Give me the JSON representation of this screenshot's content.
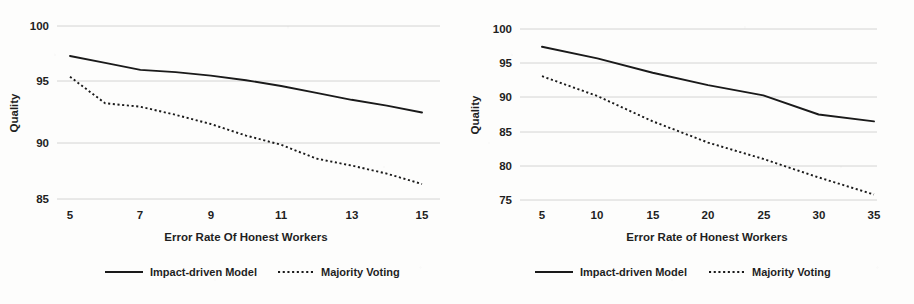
{
  "figure": {
    "panel_count": 2,
    "background_color": "#fdfdfc",
    "line_color": "#1a1a1a",
    "grid_color": "#c9c9c9"
  },
  "chart_data": [
    {
      "type": "line",
      "panel": "left",
      "title": "",
      "xlabel": "Error Rate Of Honest Workers",
      "ylabel": "Quality",
      "xlim": [
        5,
        15
      ],
      "ylim": [
        85,
        100
      ],
      "xticks": [
        5,
        7,
        9,
        11,
        13,
        15
      ],
      "yticks": [
        85,
        90,
        95,
        100
      ],
      "xtick_labels": [
        "5",
        "7",
        "9",
        "11",
        "13",
        "15"
      ],
      "ytick_labels": [
        "85",
        "90",
        "95",
        "100"
      ],
      "grid": "horizontal",
      "legend_position": "bottom",
      "x": [
        5,
        6,
        7,
        8,
        9,
        10,
        11,
        12,
        13,
        14,
        15
      ],
      "series": [
        {
          "name": "Impact-driven Model",
          "style": "solid",
          "values": [
            97.4,
            96.8,
            96.2,
            96.0,
            95.7,
            95.3,
            94.8,
            94.2,
            93.6,
            93.1,
            92.5
          ]
        },
        {
          "name": "Majority Voting",
          "style": "dotted",
          "values": [
            95.6,
            93.3,
            93.0,
            92.3,
            91.5,
            90.5,
            89.7,
            88.5,
            87.9,
            87.2,
            86.3
          ]
        }
      ]
    },
    {
      "type": "line",
      "panel": "right",
      "title": "",
      "xlabel": "Error Rate of Honest Workers",
      "ylabel": "Quality",
      "xlim": [
        5,
        35
      ],
      "ylim": [
        75,
        100
      ],
      "xticks": [
        5,
        10,
        15,
        20,
        25,
        30,
        35
      ],
      "yticks": [
        75,
        80,
        85,
        90,
        95,
        100
      ],
      "xtick_labels": [
        "5",
        "10",
        "15",
        "20",
        "25",
        "30",
        "35"
      ],
      "ytick_labels": [
        "75",
        "80",
        "85",
        "90",
        "95",
        "100"
      ],
      "grid": "horizontal",
      "legend_position": "bottom",
      "x": [
        5,
        10,
        15,
        20,
        25,
        30,
        35
      ],
      "series": [
        {
          "name": "Impact-driven Model",
          "style": "solid",
          "values": [
            97.4,
            95.7,
            93.6,
            91.8,
            90.3,
            87.5,
            86.5
          ]
        },
        {
          "name": "Majority Voting",
          "style": "dotted",
          "values": [
            93.1,
            90.2,
            86.5,
            83.4,
            81.0,
            78.3,
            75.8
          ]
        }
      ]
    }
  ]
}
